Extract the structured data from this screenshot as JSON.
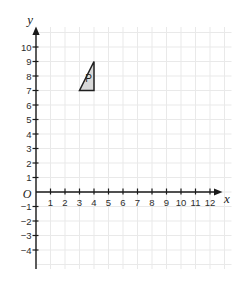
{
  "chart_data": {
    "type": "scatter",
    "title": "",
    "xlabel": "x",
    "ylabel": "y",
    "origin_label": "O",
    "x_ticks": [
      1,
      2,
      3,
      4,
      5,
      6,
      7,
      8,
      9,
      10,
      11,
      12
    ],
    "y_ticks": [
      10,
      9,
      8,
      7,
      6,
      5,
      4,
      3,
      2,
      1,
      -1,
      -2,
      -3,
      -4
    ],
    "xlim": [
      0,
      13.5
    ],
    "ylim": [
      -5.3,
      11.4
    ],
    "grid": true,
    "legend": false,
    "shapes": [
      {
        "name": "triangle-P",
        "type": "polygon",
        "label": "P",
        "vertices": [
          [
            3,
            7
          ],
          [
            4,
            7
          ],
          [
            4,
            9
          ]
        ],
        "label_pos": [
          3.63,
          7.85
        ],
        "fill": "#d9d9d9",
        "stroke": "#1f1f1f"
      }
    ]
  },
  "style": {
    "background": "#ffffff",
    "grid_color": "#e9e9e9",
    "axis_color": "#1a1a1a",
    "tick_label_color": "#2d2d2d",
    "axis_letter_color": "#1a1a1a",
    "shape_label_color": "#1f1f1f"
  }
}
